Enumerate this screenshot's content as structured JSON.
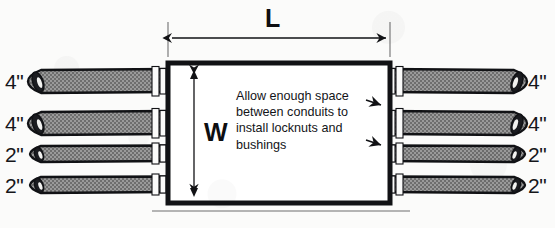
{
  "diagram": {
    "box": {
      "note_text": "Allow enough space between conduits to install locknuts and bushings",
      "width_label": "W",
      "length_label": "L"
    },
    "conduits": {
      "left": [
        {
          "label": "4\"",
          "size_in": 4
        },
        {
          "label": "4\"",
          "size_in": 4
        },
        {
          "label": "2\"",
          "size_in": 2
        },
        {
          "label": "2\"",
          "size_in": 2
        }
      ],
      "right": [
        {
          "label": "4\"",
          "size_in": 4
        },
        {
          "label": "4\"",
          "size_in": 4
        },
        {
          "label": "2\"",
          "size_in": 2
        },
        {
          "label": "2\"",
          "size_in": 2
        }
      ]
    },
    "colors": {
      "outline": "#111215",
      "conduit_fill": "#8a8a8a",
      "background": "#fbfbfa",
      "ground_line": "#b4b4b4"
    }
  }
}
